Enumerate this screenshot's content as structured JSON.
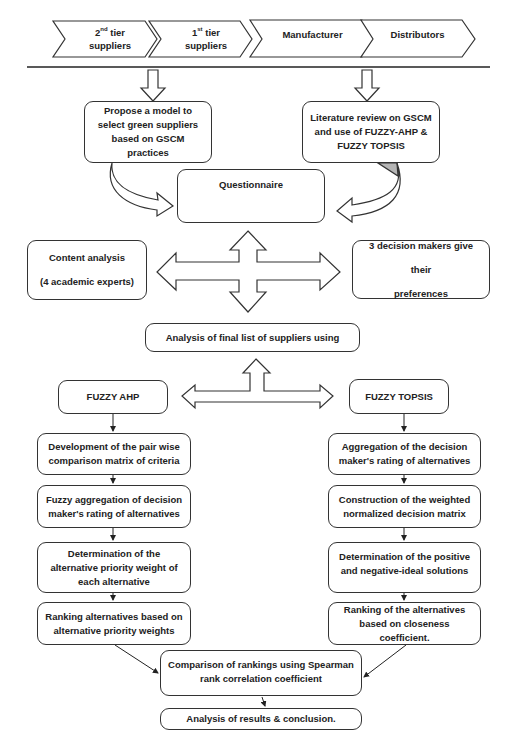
{
  "supply_chain": [
    {
      "label": "2",
      "sup": "nd",
      "rest": " tier",
      "line2": "suppliers"
    },
    {
      "label": "1",
      "sup": "st",
      "rest": " tier",
      "line2": "suppliers"
    },
    {
      "label": "Manufacturer"
    },
    {
      "label": "Distributors"
    }
  ],
  "inputs": {
    "propose": [
      "Propose a model to",
      "select green suppliers",
      "based on GSCM practices"
    ],
    "literature": [
      "Literature review on GSCM",
      "and use of FUZZY-AHP &",
      "FUZZY TOPSIS"
    ]
  },
  "questionnaire": "Questionnaire",
  "content_analysis": [
    "Content analysis",
    "(4 academic experts)"
  ],
  "decision_makers": [
    "3 decision makers give their",
    "preferences"
  ],
  "analysis_final": "Analysis of final list of suppliers using",
  "fuzzy_ahp": {
    "title": "FUZZY AHP",
    "steps": [
      [
        "Development of the pair wise",
        "comparison matrix of criteria"
      ],
      [
        "Fuzzy aggregation of decision",
        "maker's rating of alternatives"
      ],
      [
        "Determination of the",
        "alternative priority weight of",
        "each alternative"
      ],
      [
        "Ranking alternatives based on",
        "alternative priority weights"
      ]
    ]
  },
  "fuzzy_topsis": {
    "title": "FUZZY TOPSIS",
    "steps": [
      [
        "Aggregation of the decision",
        "maker's rating of alternatives"
      ],
      [
        "Construction of the weighted",
        "normalized decision matrix"
      ],
      [
        "Determination of the positive",
        "and negative-ideal solutions"
      ],
      [
        "Ranking of the alternatives",
        "based on closeness coefficient."
      ]
    ]
  },
  "comparison": [
    "Comparison of rankings using Spearman",
    "rank correlation coefficient"
  ],
  "conclusion": "Analysis of results & conclusion.",
  "colors": {
    "stroke": "#333333",
    "shade": "#b5b5b5",
    "background": "#ffffff"
  }
}
